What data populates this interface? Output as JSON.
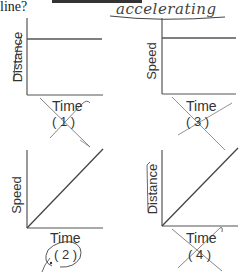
{
  "question": {
    "text_fragment": "line?",
    "handwritten_answer": "accelerating"
  },
  "graphs": [
    {
      "id": 1,
      "number_label": "( 1 )",
      "y_label": "Distance",
      "x_label": "Time",
      "shape": "horizontal",
      "crossed_out": true,
      "circled": false,
      "y_label_struck": true
    },
    {
      "id": 2,
      "number_label": "( 2 )",
      "y_label": "Speed",
      "x_label": "Time",
      "shape": "diagonal-increasing",
      "crossed_out": false,
      "circled": true,
      "y_label_struck": false
    },
    {
      "id": 3,
      "number_label": "( 3 )",
      "y_label": "Speed",
      "x_label": "Time",
      "shape": "horizontal",
      "crossed_out": true,
      "circled": false,
      "y_label_struck": false
    },
    {
      "id": 4,
      "number_label": "( 4 )",
      "y_label": "Distance",
      "x_label": "Time",
      "shape": "diagonal-increasing",
      "crossed_out": true,
      "circled": false,
      "y_label_struck": true
    }
  ],
  "colors": {
    "axis": "#555555",
    "ink": "#555555",
    "pencil": "#444444"
  }
}
